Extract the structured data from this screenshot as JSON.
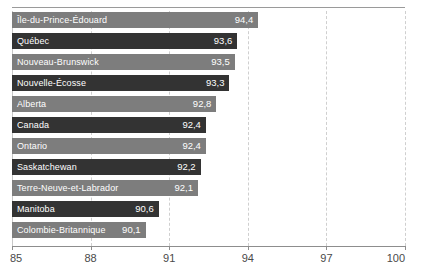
{
  "chart_data": {
    "type": "bar",
    "orientation": "horizontal",
    "title": "",
    "subtitle": "",
    "xlabel": "",
    "ylabel": "",
    "xlim": [
      85,
      100
    ],
    "xticks": [
      85,
      88,
      91,
      94,
      97,
      100
    ],
    "xtick_labels": [
      "85",
      "88",
      "91",
      "94",
      "97",
      "100"
    ],
    "grid": true,
    "grid_axis": "x",
    "grid_style": "dashed",
    "legend": false,
    "decimal_separator": ",",
    "categories": [
      "Île-du-Prince-Édouard",
      "Québec",
      "Nouveau-Brunswick",
      "Nouvelle-Écosse",
      "Alberta",
      "Canada",
      "Ontario",
      "Saskatchewan",
      "Terre-Neuve-et-Labrador",
      "Manitoba",
      "Colombie-Britannique"
    ],
    "values": [
      94.4,
      93.6,
      93.5,
      93.3,
      92.8,
      92.4,
      92.4,
      92.2,
      92.1,
      90.6,
      90.1
    ],
    "value_labels": [
      "94,4",
      "93,6",
      "93,5",
      "93,3",
      "92,8",
      "92,4",
      "92,4",
      "92,2",
      "92,1",
      "90,6",
      "90,1"
    ],
    "bar_colors": [
      "#7d7d7d",
      "#333333",
      "#7d7d7d",
      "#333333",
      "#7d7d7d",
      "#333333",
      "#7d7d7d",
      "#333333",
      "#7d7d7d",
      "#333333",
      "#7d7d7d"
    ],
    "label_text_color": "#ffffff",
    "axis_color": "#8d8d8d",
    "gridline_color": "#cfcfcf",
    "background": "#ffffff"
  },
  "bars": [
    {
      "label": "Île-du-Prince-Édouard",
      "value_label": "94,4",
      "value": 94.4,
      "shade": "light"
    },
    {
      "label": "Québec",
      "value_label": "93,6",
      "value": 93.6,
      "shade": "dark"
    },
    {
      "label": "Nouveau-Brunswick",
      "value_label": "93,5",
      "value": 93.5,
      "shade": "light"
    },
    {
      "label": "Nouvelle-Écosse",
      "value_label": "93,3",
      "value": 93.3,
      "shade": "dark"
    },
    {
      "label": "Alberta",
      "value_label": "92,8",
      "value": 92.8,
      "shade": "light"
    },
    {
      "label": "Canada",
      "value_label": "92,4",
      "value": 92.4,
      "shade": "dark"
    },
    {
      "label": "Ontario",
      "value_label": "92,4",
      "value": 92.4,
      "shade": "light"
    },
    {
      "label": "Saskatchewan",
      "value_label": "92,2",
      "value": 92.2,
      "shade": "dark"
    },
    {
      "label": "Terre-Neuve-et-Labrador",
      "value_label": "92,1",
      "value": 92.1,
      "shade": "light"
    },
    {
      "label": "Manitoba",
      "value_label": "90,6",
      "value": 90.6,
      "shade": "dark"
    },
    {
      "label": "Colombie-Britannique",
      "value_label": "90,1",
      "value": 90.1,
      "shade": "light"
    }
  ],
  "axis": {
    "ticks": [
      "85",
      "88",
      "91",
      "94",
      "97",
      "100"
    ]
  }
}
